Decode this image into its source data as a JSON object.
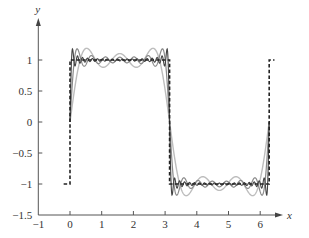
{
  "chart_data": {
    "type": "line",
    "title": "",
    "xlabel": "x",
    "ylabel": "y",
    "xlim": [
      -1,
      6.7
    ],
    "ylim": [
      -1.5,
      1.5
    ],
    "x_ticks": [
      -1,
      0,
      1,
      2,
      3,
      4,
      5,
      6
    ],
    "x_tick_labels": [
      "−1",
      "0",
      "1",
      "2",
      "3",
      "4",
      "5",
      "6"
    ],
    "y_ticks": [
      -1.5,
      -1,
      -0.5,
      0,
      0.5,
      1
    ],
    "y_tick_labels": [
      "−1.5",
      "−1",
      "−0.5",
      "0",
      "0.5",
      "1"
    ],
    "grid": false,
    "legend": null,
    "series": [
      {
        "name": "square wave",
        "kind": "step",
        "style": "dashed",
        "color": "#222222",
        "points": [
          [
            -0.2,
            -1
          ],
          [
            0,
            -1
          ],
          [
            0,
            1
          ],
          [
            3.1416,
            1
          ],
          [
            3.1416,
            -1
          ],
          [
            6.2832,
            -1
          ],
          [
            6.2832,
            1
          ],
          [
            6.45,
            1
          ]
        ]
      },
      {
        "name": "Fourier partial sum (3 terms)",
        "kind": "fourier_square",
        "odd_terms": 3,
        "x_range": [
          0,
          6.2832
        ],
        "color": "#bdbdbd",
        "width": 1.4
      },
      {
        "name": "Fourier partial sum (7 terms)",
        "kind": "fourier_square",
        "odd_terms": 7,
        "x_range": [
          0,
          6.2832
        ],
        "color": "#8a8a8a",
        "width": 1.2
      },
      {
        "name": "Fourier partial sum (20 terms)",
        "kind": "fourier_square",
        "odd_terms": 20,
        "x_range": [
          0,
          6.2832
        ],
        "color": "#444444",
        "width": 1.1
      }
    ]
  },
  "layout": {
    "origin_px": {
      "x0": 70,
      "y0": 122
    },
    "scale_px": {
      "x": 31.7,
      "y": 62
    }
  }
}
